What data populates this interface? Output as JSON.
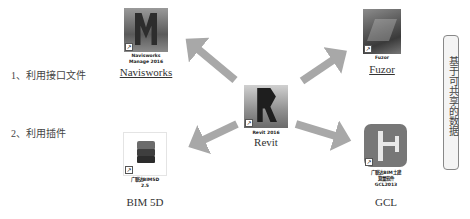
{
  "methods": [
    {
      "label": "1、利用接口文件"
    },
    {
      "label": "2、利用插件"
    }
  ],
  "center": {
    "icon": "revit-icon",
    "caption": "Revit 2016",
    "label": "Revit"
  },
  "nodes": [
    {
      "id": "navisworks",
      "icon": "navisworks-icon",
      "caption_line1": "Navisworks",
      "caption_line2": "Manage 2016",
      "label": "Navisworks",
      "underlined": true
    },
    {
      "id": "fuzor",
      "icon": "fuzor-icon",
      "caption_line1": "Fuzor",
      "label": "Fuzor",
      "underlined": true
    },
    {
      "id": "bim5d",
      "icon": "bim5d-icon",
      "caption_line1": "广联达BIM5D",
      "caption_line2": "2.5",
      "label": "BIM 5D",
      "underlined": false
    },
    {
      "id": "gcl",
      "icon": "gcl-icon",
      "caption_line1": "广联达BIM土建",
      "caption_line2": "算量软件",
      "caption_line3": "GCL2013",
      "label": "GCL",
      "underlined": false
    }
  ],
  "sidebar": {
    "text": "基于可共享的数据"
  },
  "colors": {
    "arrow_fill": "#a8a8a8",
    "arrow_stroke": "#8a8a8a",
    "gcl_bg": "#777777",
    "gcl_glyph": "#e8e8e8"
  }
}
